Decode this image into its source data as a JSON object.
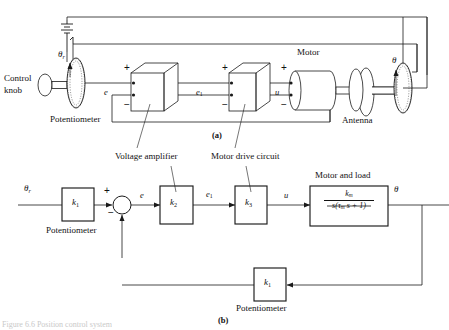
{
  "figure": {
    "caption_bottom": "Figure 6.6 Position control system",
    "part_a_label": "(a)",
    "part_b_label": "(b)"
  },
  "schematic": {
    "control_knob": "Control\nknob",
    "control_knob_line1": "Control",
    "control_knob_line2": "knob",
    "theta_r": "θ",
    "theta_r_sub": "r",
    "theta_out": "θ",
    "potentiometer_left": "Potentiometer",
    "motor": "Motor",
    "antenna": "Antenna",
    "signal_e": "e",
    "signal_e1": "e",
    "signal_e1_sub": "1",
    "signal_u": "u",
    "plus": "+",
    "minus": "−",
    "battery_icon": "battery-icon"
  },
  "block_diagram": {
    "input_label": "θ",
    "input_sub": "r",
    "output_label": "θ",
    "blocks": [
      {
        "name": "input-potentiometer",
        "gain": "k",
        "sub": "1",
        "caption": "Potentiometer"
      },
      {
        "name": "voltage-amplifier",
        "gain": "k",
        "sub": "2",
        "caption": "Voltage amplifier"
      },
      {
        "name": "motor-drive-circuit",
        "gain": "k",
        "sub": "3",
        "caption": "Motor drive circuit"
      },
      {
        "name": "motor-and-load",
        "caption": "Motor and load"
      },
      {
        "name": "feedback-potentiometer",
        "gain": "k",
        "sub": "1",
        "caption": "Potentiometer"
      }
    ],
    "transfer_function": {
      "numerator": "k",
      "numerator_sub": "m",
      "denominator_pre": "s(τ",
      "denominator_sub": "m",
      "denominator_post": " s + 1)"
    },
    "summing_junction": {
      "plus": "+",
      "minus": "−",
      "error_signal": "e"
    },
    "signal_e1": "e",
    "signal_e1_sub": "1",
    "signal_u": "u"
  },
  "colors": {
    "line": "#1a1a1a",
    "fill": "#ffffff",
    "faint": "#c9c9c9"
  }
}
